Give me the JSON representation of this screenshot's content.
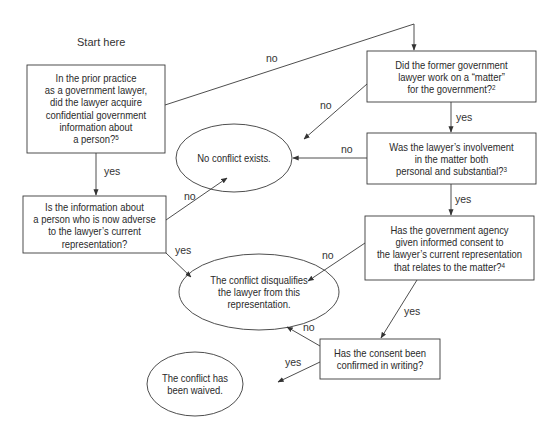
{
  "diagram": {
    "type": "flowchart",
    "start_label": "Start here",
    "nodes": {
      "q_prior_practice": {
        "shape": "rectangle",
        "lines": [
          "In the prior practice",
          "as a government lawyer,",
          "did the lawyer acquire",
          "confidential government",
          "information about",
          "a person?"
        ],
        "footnote": "5"
      },
      "q_matter": {
        "shape": "rectangle",
        "lines": [
          "Did the former government",
          "lawyer work on a “matter”",
          "for the government?"
        ],
        "footnote": "2"
      },
      "q_involvement": {
        "shape": "rectangle",
        "lines": [
          "Was the lawyer’s involvement",
          "in the matter both",
          "personal and substantial?"
        ],
        "footnote": "3"
      },
      "q_adverse": {
        "shape": "rectangle",
        "lines": [
          "Is the information about",
          "a person who is now adverse",
          "to the lawyer’s current",
          "representation?"
        ]
      },
      "q_consent": {
        "shape": "rectangle",
        "lines": [
          "Has the government agency",
          "given informed consent to",
          "the lawyer’s current representation",
          "that relates to the matter?"
        ],
        "footnote": "4"
      },
      "q_writing": {
        "shape": "rectangle",
        "lines": [
          "Has the consent been",
          "confirmed in writing?"
        ]
      },
      "r_no_conflict": {
        "shape": "ellipse",
        "lines": [
          "No conflict exists."
        ]
      },
      "r_disqualifies": {
        "shape": "ellipse",
        "lines": [
          "The conflict disqualifies",
          "the lawyer from this",
          "representation."
        ]
      },
      "r_waived": {
        "shape": "ellipse",
        "lines": [
          "The conflict has",
          "been waived."
        ]
      }
    },
    "edges": [
      {
        "from": "q_prior_practice",
        "to": "q_matter",
        "label": "no"
      },
      {
        "from": "q_prior_practice",
        "to": "q_adverse",
        "label": "yes"
      },
      {
        "from": "q_matter",
        "to": "r_no_conflict",
        "label": "no"
      },
      {
        "from": "q_matter",
        "to": "q_involvement",
        "label": "yes"
      },
      {
        "from": "q_involvement",
        "to": "r_no_conflict",
        "label": "no"
      },
      {
        "from": "q_involvement",
        "to": "q_consent",
        "label": "yes"
      },
      {
        "from": "q_adverse",
        "to": "r_no_conflict",
        "label": "no"
      },
      {
        "from": "q_adverse",
        "to": "r_disqualifies",
        "label": "yes"
      },
      {
        "from": "q_consent",
        "to": "r_disqualifies",
        "label": "no"
      },
      {
        "from": "q_consent",
        "to": "q_writing",
        "label": "yes"
      },
      {
        "from": "q_writing",
        "to": "r_disqualifies",
        "label": "no"
      },
      {
        "from": "q_writing",
        "to": "r_waived",
        "label": "yes"
      }
    ],
    "colors": {
      "stroke": "#3a3a3a",
      "text": "#2a2a2a",
      "background": "#ffffff"
    }
  }
}
